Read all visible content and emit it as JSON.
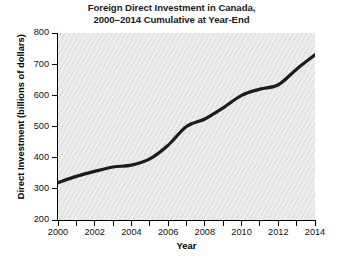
{
  "chart_data": {
    "type": "line",
    "title": "Foreign Direct Investment in Canada, 2000–2014 Cumulative at Year-End",
    "title_lines": [
      "Foreign Direct Investment in Canada,",
      "2000–2014 Cumulative at Year-End"
    ],
    "xlabel": "Year",
    "ylabel": "Direct Investment (billions of dollars)",
    "xlim": [
      2000,
      2014
    ],
    "ylim": [
      200,
      800
    ],
    "yticks": [
      200,
      300,
      400,
      500,
      600,
      700,
      800
    ],
    "ytick_labels": [
      "200",
      "300",
      "400",
      "500",
      "600",
      "700",
      "800"
    ],
    "xticks": [
      2000,
      2001,
      2002,
      2003,
      2004,
      2005,
      2006,
      2007,
      2008,
      2009,
      2010,
      2011,
      2012,
      2013,
      2014
    ],
    "xtick_labels_major": [
      "2000",
      "2002",
      "2004",
      "2006",
      "2008",
      "2010",
      "2012",
      "2014"
    ],
    "xticks_major": [
      2000,
      2002,
      2004,
      2006,
      2008,
      2010,
      2012,
      2014
    ],
    "grid": false,
    "legend": false,
    "x": [
      2000,
      2001,
      2002,
      2003,
      2004,
      2005,
      2006,
      2007,
      2008,
      2009,
      2010,
      2011,
      2012,
      2013,
      2014
    ],
    "values": [
      320,
      340,
      356,
      370,
      376,
      396,
      440,
      500,
      524,
      560,
      600,
      620,
      634,
      684,
      730
    ],
    "series": [
      {
        "name": "Cumulative foreign direct investment",
        "color": "#1c1c1c",
        "line_width": 3.2,
        "values": [
          320,
          340,
          356,
          370,
          376,
          396,
          440,
          500,
          524,
          560,
          600,
          620,
          634,
          684,
          730
        ]
      }
    ],
    "plot_background": "#e9e9e9",
    "figure_background": "#ffffff",
    "axis_color": "#000000"
  }
}
